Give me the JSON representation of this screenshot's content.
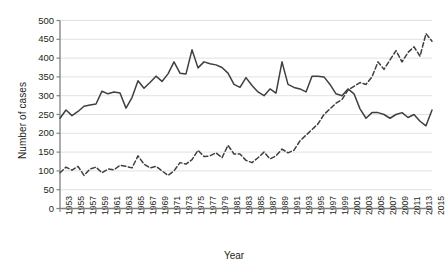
{
  "chart_data": {
    "type": "line",
    "title": "",
    "xlabel": "Year",
    "ylabel": "Number of cases",
    "ylim": [
      0,
      500
    ],
    "ytick_step": 50,
    "yticks": [
      0,
      50,
      100,
      150,
      200,
      250,
      300,
      350,
      400,
      450,
      500
    ],
    "xlim": [
      1953,
      2015
    ],
    "xticks": [
      1953,
      1955,
      1957,
      1959,
      1961,
      1963,
      1965,
      1967,
      1969,
      1971,
      1973,
      1975,
      1977,
      1979,
      1981,
      1983,
      1985,
      1987,
      1989,
      1991,
      1993,
      1995,
      1997,
      1999,
      2001,
      2003,
      2005,
      2007,
      2009,
      2011,
      2013,
      2015
    ],
    "grid": true,
    "grid_axis": "y",
    "legend": "none",
    "colors": {
      "series_solid": "#3f3f3f",
      "series_dashed": "#3f3f3f",
      "grid": "#d9d9d9",
      "axis": "#808080",
      "text": "#231f20"
    },
    "x": [
      1953,
      1954,
      1955,
      1956,
      1957,
      1958,
      1959,
      1960,
      1961,
      1962,
      1963,
      1964,
      1965,
      1966,
      1967,
      1968,
      1969,
      1970,
      1971,
      1972,
      1973,
      1974,
      1975,
      1976,
      1977,
      1978,
      1979,
      1980,
      1981,
      1982,
      1983,
      1984,
      1985,
      1986,
      1987,
      1988,
      1989,
      1990,
      1991,
      1992,
      1993,
      1994,
      1995,
      1996,
      1997,
      1998,
      1999,
      2000,
      2001,
      2002,
      2003,
      2004,
      2005,
      2006,
      2007,
      2008,
      2009,
      2010,
      2011,
      2012,
      2013,
      2014,
      2015
    ],
    "series": [
      {
        "name": "Series A (solid)",
        "style": "solid",
        "values": [
          240,
          262,
          247,
          258,
          272,
          275,
          278,
          312,
          305,
          310,
          307,
          267,
          295,
          340,
          320,
          335,
          352,
          338,
          358,
          390,
          360,
          358,
          422,
          374,
          390,
          385,
          382,
          375,
          360,
          330,
          322,
          348,
          327,
          310,
          300,
          318,
          307,
          390,
          330,
          322,
          318,
          310,
          352,
          352,
          350,
          330,
          305,
          300,
          318,
          305,
          265,
          240,
          255,
          255,
          250,
          240,
          250,
          255,
          242,
          250,
          232,
          220,
          262
        ]
      },
      {
        "name": "Series B (dashed)",
        "style": "dashed",
        "values": [
          95,
          110,
          102,
          112,
          88,
          105,
          110,
          95,
          105,
          103,
          115,
          112,
          108,
          140,
          118,
          108,
          112,
          100,
          88,
          100,
          122,
          118,
          130,
          155,
          138,
          140,
          148,
          135,
          168,
          145,
          145,
          128,
          122,
          135,
          150,
          132,
          140,
          158,
          148,
          155,
          180,
          195,
          210,
          225,
          250,
          265,
          280,
          290,
          315,
          325,
          335,
          330,
          350,
          390,
          370,
          395,
          420,
          390,
          415,
          430,
          405,
          465,
          445
        ]
      }
    ]
  }
}
